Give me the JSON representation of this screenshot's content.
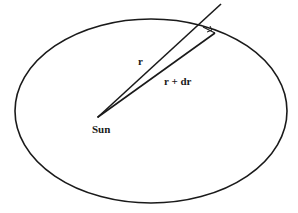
{
  "diagram": {
    "labels": {
      "sun": "Sun",
      "r": "r",
      "r_dr": "r + dr"
    },
    "colors": {
      "stroke": "#1a1a1a",
      "background": "#ffffff"
    },
    "ellipse": {
      "cx": 151,
      "cy": 111,
      "rx": 136,
      "ry": 92
    },
    "sun_point": {
      "x": 98,
      "y": 117
    },
    "radius_line_end": {
      "x": 221,
      "y": 4
    },
    "radius_dr_line_end": {
      "x": 215,
      "y": 33
    }
  }
}
